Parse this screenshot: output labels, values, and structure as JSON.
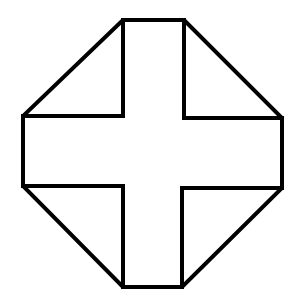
{
  "diagram": {
    "stroke_color": "#000000",
    "background_color": "#ffffff",
    "stroke_width": 4,
    "octagon_points": "123,20 184,20 282,118 282,188 182,287 123,287 23,186 23,116",
    "cross_points": "123,20 184,20 184,118 282,118 282,188 182,188 182,287 123,287 123,186 23,186 23,116 123,116"
  }
}
